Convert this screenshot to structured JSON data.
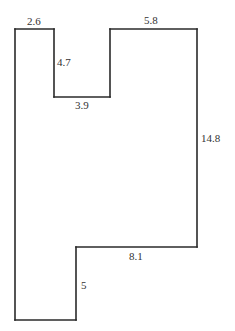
{
  "diagram": {
    "type": "rectilinear-polygon",
    "colors": {
      "stroke": "#2a2a2a",
      "label": "#333333",
      "background": "#ffffff"
    },
    "sides": [
      {
        "id": "top-left",
        "label": "2.6"
      },
      {
        "id": "notch-left",
        "label": "4.7"
      },
      {
        "id": "notch-bottom",
        "label": "3.9"
      },
      {
        "id": "top-right",
        "label": "5.8"
      },
      {
        "id": "right",
        "label": "14.8"
      },
      {
        "id": "step-horizontal",
        "label": "8.1"
      },
      {
        "id": "step-vertical",
        "label": "5"
      }
    ]
  }
}
